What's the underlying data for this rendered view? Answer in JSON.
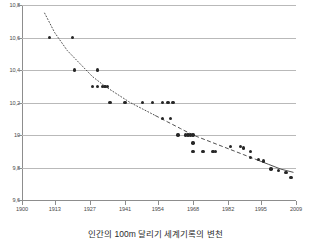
{
  "caption": "인간의 100m 달리기 세계기록의 변천",
  "chart_data": {
    "type": "scatter",
    "title": "",
    "subtitle": "",
    "xlabel": "",
    "ylabel": "",
    "xlim": [
      1900,
      2009
    ],
    "ylim": [
      9.6,
      10.8
    ],
    "grid": "horizontal",
    "legend": "none",
    "decimal_separator": ",",
    "xticks": [
      1900,
      1913,
      1927,
      1941,
      1954,
      1968,
      1982,
      1995,
      2009
    ],
    "xtick_labels": [
      "1900",
      "1913",
      "1927",
      "1941",
      "1954",
      "1968",
      "1982",
      "1995",
      "2009"
    ],
    "yticks": [
      9.6,
      9.8,
      10.0,
      10.2,
      10.4,
      10.6,
      10.8
    ],
    "ytick_labels": [
      "9,6",
      "9,8",
      "10",
      "10,2",
      "10,4",
      "10,6",
      "10,8"
    ],
    "marker_color": "#262626",
    "grid_color": "#b9b9b9",
    "trend_color": "#3c3c3c",
    "trend_style": "dotted-to-solid",
    "series": [
      {
        "name": "100m world record",
        "points": [
          [
            1911,
            10.6
          ],
          [
            1920,
            10.6
          ],
          [
            1921,
            10.4
          ],
          [
            1930,
            10.4
          ],
          [
            1928,
            10.3
          ],
          [
            1930,
            10.3
          ],
          [
            1932,
            10.3
          ],
          [
            1933,
            10.3
          ],
          [
            1934,
            10.3
          ],
          [
            1935,
            10.2
          ],
          [
            1941,
            10.2
          ],
          [
            1948,
            10.2
          ],
          [
            1952,
            10.2
          ],
          [
            1956,
            10.2
          ],
          [
            1958,
            10.2
          ],
          [
            1960,
            10.2
          ],
          [
            1956,
            10.1
          ],
          [
            1959,
            10.1
          ],
          [
            1962,
            10.0
          ],
          [
            1965,
            10.0
          ],
          [
            1966,
            10.0
          ],
          [
            1967,
            10.0
          ],
          [
            1968,
            10.0
          ],
          [
            1968,
            9.95
          ],
          [
            1968,
            9.9
          ],
          [
            1972,
            9.9
          ],
          [
            1976,
            9.9
          ],
          [
            1977,
            9.9
          ],
          [
            1983,
            9.93
          ],
          [
            1987,
            9.93
          ],
          [
            1988,
            9.92
          ],
          [
            1991,
            9.9
          ],
          [
            1991,
            9.86
          ],
          [
            1994,
            9.85
          ],
          [
            1996,
            9.84
          ],
          [
            1999,
            9.79
          ],
          [
            2002,
            9.78
          ],
          [
            2005,
            9.77
          ],
          [
            2007,
            9.74
          ]
        ]
      }
    ],
    "trend": {
      "name": "fitted decline curve",
      "points": [
        [
          1909,
          10.75
        ],
        [
          1913,
          10.63
        ],
        [
          1918,
          10.52
        ],
        [
          1923,
          10.44
        ],
        [
          1928,
          10.36
        ],
        [
          1933,
          10.3
        ],
        [
          1938,
          10.25
        ],
        [
          1943,
          10.2
        ],
        [
          1948,
          10.16
        ],
        [
          1953,
          10.12
        ],
        [
          1958,
          10.08
        ],
        [
          1963,
          10.04
        ],
        [
          1968,
          10.0
        ],
        [
          1973,
          9.97
        ],
        [
          1978,
          9.94
        ],
        [
          1983,
          9.91
        ],
        [
          1988,
          9.88
        ],
        [
          1993,
          9.85
        ],
        [
          1998,
          9.82
        ],
        [
          2003,
          9.79
        ],
        [
          2008,
          9.77
        ]
      ]
    }
  }
}
